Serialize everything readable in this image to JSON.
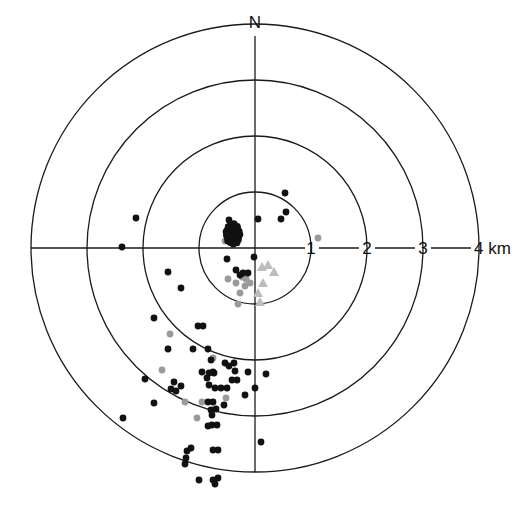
{
  "chart_data": {
    "type": "scatter",
    "title": "",
    "center": {
      "x": 255,
      "y": 248
    },
    "km_px": 56,
    "north_label": "N",
    "ring_labels": [
      "1",
      "2",
      "3",
      "4 km"
    ],
    "rings_km": [
      1,
      2,
      3,
      4
    ],
    "colors": {
      "black": "#111111",
      "gray": "#9a9a9a",
      "light": "#bdbdbd",
      "line": "#1a1a1a"
    },
    "black_points": [
      [
        285,
        193
      ],
      [
        286,
        212
      ],
      [
        281,
        219
      ],
      [
        258,
        219
      ],
      [
        136,
        218
      ],
      [
        122,
        247
      ],
      [
        227,
        259
      ],
      [
        254,
        257
      ],
      [
        168,
        272
      ],
      [
        181,
        288
      ],
      [
        229,
        220
      ],
      [
        231,
        225
      ],
      [
        233,
        230
      ],
      [
        236,
        233
      ],
      [
        238,
        238
      ],
      [
        232,
        238
      ],
      [
        227,
        235
      ],
      [
        230,
        242
      ],
      [
        236,
        228
      ],
      [
        239,
        232
      ],
      [
        236,
        270
      ],
      [
        240,
        275
      ],
      [
        243,
        273
      ],
      [
        248,
        273
      ],
      [
        154,
        318
      ],
      [
        198,
        326
      ],
      [
        203,
        326
      ],
      [
        168,
        349
      ],
      [
        193,
        349
      ],
      [
        208,
        349
      ],
      [
        211,
        360
      ],
      [
        225,
        363
      ],
      [
        229,
        366
      ],
      [
        234,
        363
      ],
      [
        213,
        372
      ],
      [
        248,
        372
      ],
      [
        235,
        371
      ],
      [
        145,
        379
      ],
      [
        174,
        382
      ],
      [
        181,
        386
      ],
      [
        171,
        389
      ],
      [
        176,
        391
      ],
      [
        202,
        372
      ],
      [
        209,
        373
      ],
      [
        214,
        373
      ],
      [
        207,
        378
      ],
      [
        209,
        385
      ],
      [
        232,
        380
      ],
      [
        237,
        380
      ],
      [
        255,
        388
      ],
      [
        215,
        388
      ],
      [
        221,
        388
      ],
      [
        227,
        388
      ],
      [
        245,
        395
      ],
      [
        266,
        374
      ],
      [
        154,
        403
      ],
      [
        208,
        402
      ],
      [
        213,
        402
      ],
      [
        211,
        410
      ],
      [
        216,
        409
      ],
      [
        224,
        405
      ],
      [
        212,
        415
      ],
      [
        212,
        425
      ],
      [
        217,
        425
      ],
      [
        208,
        426
      ],
      [
        123,
        418
      ],
      [
        261,
        442
      ],
      [
        187,
        451
      ],
      [
        191,
        448
      ],
      [
        186,
        458
      ],
      [
        213,
        450
      ],
      [
        218,
        450
      ],
      [
        185,
        464
      ],
      [
        199,
        480
      ],
      [
        213,
        480
      ],
      [
        218,
        478
      ],
      [
        215,
        484
      ]
    ],
    "gray_points": [
      [
        318,
        238
      ],
      [
        225,
        241
      ],
      [
        228,
        279
      ],
      [
        236,
        283
      ],
      [
        240,
        293
      ],
      [
        238,
        304
      ],
      [
        242,
        277
      ],
      [
        246,
        279
      ],
      [
        250,
        283
      ],
      [
        245,
        286
      ],
      [
        170,
        334
      ],
      [
        213,
        358
      ],
      [
        162,
        370
      ],
      [
        226,
        398
      ],
      [
        185,
        402
      ],
      [
        202,
        402
      ],
      [
        197,
        418
      ]
    ],
    "triangles": [
      [
        262,
        267
      ],
      [
        268,
        265
      ],
      [
        274,
        272
      ],
      [
        263,
        283
      ],
      [
        258,
        293
      ],
      [
        260,
        302
      ]
    ]
  }
}
